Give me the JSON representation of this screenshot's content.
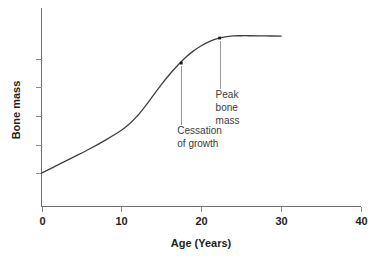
{
  "chart_data": {
    "type": "line",
    "title": "",
    "xlabel": "Age (Years)",
    "ylabel": "Bone mass",
    "xlim": [
      0,
      40
    ],
    "ylim": [
      0,
      1
    ],
    "grid": false,
    "legend": "none",
    "x_ticks": [
      "0",
      "10",
      "20",
      "30",
      "40"
    ],
    "x_tick_values": [
      0,
      10,
      20,
      30,
      40
    ],
    "y_ticks": [],
    "y_tick_values": [
      0.2,
      0.36,
      0.52,
      0.68,
      0.84
    ],
    "series": [
      {
        "name": "Bone mass",
        "x": [
          0,
          2,
          4,
          6,
          8,
          10,
          11,
          12,
          13,
          14,
          15,
          16,
          17,
          18,
          19,
          20,
          21,
          22,
          23,
          24,
          25,
          26,
          28,
          30
        ],
        "y": [
          0.2,
          0.245,
          0.29,
          0.335,
          0.385,
          0.44,
          0.475,
          0.52,
          0.575,
          0.635,
          0.695,
          0.75,
          0.8,
          0.845,
          0.882,
          0.912,
          0.935,
          0.952,
          0.962,
          0.967,
          0.968,
          0.968,
          0.967,
          0.966
        ]
      }
    ],
    "annotations": [
      {
        "id": "cessation-of-growth",
        "lines": [
          "Cessation",
          "of growth"
        ],
        "point_x": 17.5,
        "point_y": 0.815,
        "text_x": 17.5,
        "text_y": 0.42
      },
      {
        "id": "peak-bone-mass",
        "lines": [
          "Peak",
          "bone",
          "mass"
        ],
        "point_x": 22.3,
        "point_y": 0.955,
        "text_x": 22.3,
        "text_y": 0.62
      }
    ],
    "colors": {
      "curve": "#3f3f3f",
      "axis": "#6d6e71",
      "leader": "#9a9a9a",
      "text": "#231f20",
      "annotation_text": "#3a3a3a",
      "background": "#ffffff"
    }
  }
}
